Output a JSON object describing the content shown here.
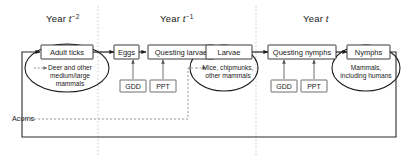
{
  "diagram": {
    "colors": {
      "stroke": "#1c1c1c",
      "environment_stroke": "#555555",
      "divider": "#b5b5b5",
      "background": "#ffffff"
    },
    "year_labels": [
      {
        "name": "year-t-minus-2",
        "prefix": "Year ",
        "variable": "t",
        "exponent": "−2"
      },
      {
        "name": "year-t-minus-1",
        "prefix": "Year ",
        "variable": "t",
        "exponent": "−1"
      },
      {
        "name": "year-t",
        "prefix": "Year ",
        "variable": "t",
        "exponent": ""
      }
    ],
    "stages": [
      {
        "id": "adult-ticks",
        "label": "Adult ticks",
        "shape": "box-in-ellipse",
        "host_label_lines": [
          "Deer and other",
          "medium/large",
          "mammals"
        ]
      },
      {
        "id": "eggs",
        "label": "Eggs",
        "shape": "box",
        "host_label_lines": []
      },
      {
        "id": "questing-larvae",
        "label": "Questing larvae",
        "shape": "box",
        "host_label_lines": []
      },
      {
        "id": "larvae",
        "label": "Larvae",
        "shape": "box-in-ellipse",
        "host_label_lines": [
          "Mice, chipmunks,",
          "other mammals"
        ]
      },
      {
        "id": "questing-nymphs",
        "label": "Questing nymphs",
        "shape": "box",
        "host_label_lines": []
      },
      {
        "id": "nymphs",
        "label": "Nymphs",
        "shape": "box-in-ellipse",
        "host_label_lines": [
          "Mammals,",
          "including humans"
        ]
      }
    ],
    "environment_drivers": [
      {
        "id": "gdd-larvae",
        "label": "GDD",
        "target": "questing-larvae"
      },
      {
        "id": "ppt-larvae",
        "label": "PPT",
        "target": "questing-larvae"
      },
      {
        "id": "gdd-nymphs",
        "label": "GDD",
        "target": "questing-nymphs"
      },
      {
        "id": "ppt-nymphs",
        "label": "PPT",
        "target": "questing-nymphs"
      }
    ],
    "acorns": {
      "label": "Acorns",
      "target": "larvae-hosts"
    }
  }
}
